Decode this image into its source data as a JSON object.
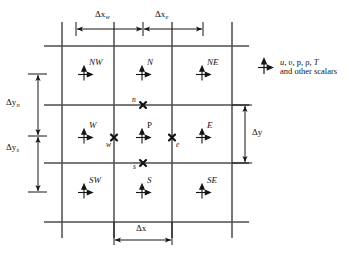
{
  "figure": {
    "colors": {
      "gridline": "#4d4d4d",
      "glyph": "#141414",
      "text": "#141414",
      "background": "#ffffff"
    }
  },
  "nodes": [
    {
      "id": "NW",
      "label": "NW",
      "italic": true,
      "x": 85,
      "y": 72
    },
    {
      "id": "N",
      "label": "N",
      "italic": true,
      "x": 143,
      "y": 72
    },
    {
      "id": "NE",
      "label": "NE",
      "italic": true,
      "x": 203,
      "y": 72
    },
    {
      "id": "W",
      "label": "W",
      "italic": true,
      "x": 85,
      "y": 135
    },
    {
      "id": "P",
      "label": "P",
      "italic": false,
      "x": 143,
      "y": 135
    },
    {
      "id": "E",
      "label": "E",
      "italic": true,
      "x": 203,
      "y": 135
    },
    {
      "id": "SW",
      "label": "SW",
      "italic": true,
      "x": 85,
      "y": 190
    },
    {
      "id": "S",
      "label": "S",
      "italic": true,
      "x": 143,
      "y": 190
    },
    {
      "id": "SE",
      "label": "SE",
      "italic": true,
      "x": 203,
      "y": 190
    }
  ],
  "faces": [
    {
      "id": "n",
      "label": "n",
      "x": 143,
      "y": 105,
      "label_side": "left-above"
    },
    {
      "id": "w",
      "label": "w",
      "x": 114,
      "y": 135,
      "label_side": "left-below"
    },
    {
      "id": "e",
      "label": "e",
      "x": 172,
      "y": 135,
      "label_side": "right-below"
    },
    {
      "id": "s",
      "label": "s",
      "x": 143,
      "y": 163,
      "label_side": "left-below"
    }
  ],
  "dimensions": {
    "dx_w": {
      "base": "Δx",
      "sub": "w",
      "x": 104,
      "y": 16
    },
    "dx_e": {
      "base": "Δx",
      "sub": "e",
      "x": 163,
      "y": 16
    },
    "dy_n": {
      "base": "Δy",
      "sub": "n",
      "x": 17,
      "y": 103
    },
    "dy_s": {
      "base": "Δy",
      "sub": "s",
      "x": 17,
      "y": 148
    },
    "dy": {
      "base": "Δy",
      "sub": "",
      "x": 253,
      "y": 133
    },
    "dx": {
      "base": "Δx",
      "sub": "",
      "x": 150,
      "y": 231
    }
  },
  "legend": {
    "symbol": "velocity-cross-glyph",
    "line1_parts": [
      {
        "text": "u",
        "italic": true
      },
      {
        "text": ", ",
        "italic": false
      },
      {
        "text": "υ",
        "italic": true
      },
      {
        "text": ", p, ρ, ",
        "italic": false
      },
      {
        "text": "T",
        "italic": true
      }
    ],
    "line1_plain": "u, υ, p, ρ, T",
    "line2": "and other scalars",
    "x": 280,
    "y": 63
  },
  "grid": {
    "vertical_lines_x": [
      62,
      114,
      172,
      232
    ],
    "horizontal_lines_y": [
      46,
      105,
      163,
      222
    ],
    "cell_columns": 3,
    "cell_rows": 3
  }
}
